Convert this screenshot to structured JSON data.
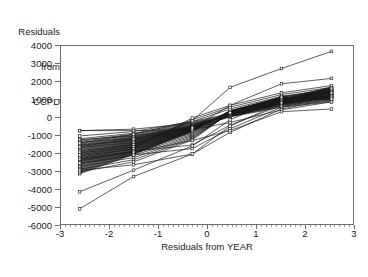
{
  "chart_data": {
    "type": "line",
    "title": "",
    "ylabel_lines": [
      "Residuals",
      "from",
      "CCPD"
    ],
    "xlabel": "Residuals from YEAR",
    "xlim": [
      -3,
      3
    ],
    "ylim": [
      -6000,
      4000
    ],
    "xticks": [
      -3,
      -2,
      -1,
      0,
      1,
      2,
      3
    ],
    "xticklabels": [
      "-3",
      "-2",
      "-1",
      "0",
      "1",
      "2",
      "3"
    ],
    "yticks": [
      -6000,
      -5000,
      -4000,
      -3000,
      -2000,
      -1000,
      0,
      1000,
      2000,
      3000,
      4000
    ],
    "yticklabels": [
      "-6000",
      "-5000",
      "-4000",
      "-3000",
      "-2000",
      "-1000",
      "0",
      "1000",
      "2000",
      "3000",
      "4000"
    ],
    "grid": false,
    "legend": null,
    "marker": "open-square",
    "line_color": "#1a1a1a",
    "frame_color": "#6e6e6e",
    "x": [
      -2.62,
      -1.52,
      -0.32,
      0.45,
      1.5,
      2.52
    ],
    "series": [
      {
        "name": "s1",
        "values": [
          -700,
          -620,
          -300,
          100,
          700,
          1150
        ]
      },
      {
        "name": "s2",
        "values": [
          -1000,
          -750,
          -200,
          250,
          900,
          1250
        ]
      },
      {
        "name": "s3",
        "values": [
          -1150,
          -850,
          -250,
          200,
          850,
          1200
        ]
      },
      {
        "name": "s4",
        "values": [
          -1250,
          -900,
          -300,
          180,
          820,
          1180
        ]
      },
      {
        "name": "s5",
        "values": [
          -1300,
          -950,
          -350,
          150,
          800,
          1160
        ]
      },
      {
        "name": "s6",
        "values": [
          -1400,
          -1000,
          -380,
          140,
          790,
          1200
        ]
      },
      {
        "name": "s7",
        "values": [
          -1450,
          -1050,
          -400,
          130,
          780,
          1220
        ]
      },
      {
        "name": "s8",
        "values": [
          -1500,
          -1080,
          -420,
          120,
          770,
          1150
        ]
      },
      {
        "name": "s9",
        "values": [
          -1550,
          -1100,
          -430,
          140,
          800,
          1260
        ]
      },
      {
        "name": "s10",
        "values": [
          -1600,
          -1150,
          -450,
          150,
          830,
          1300
        ]
      },
      {
        "name": "s11",
        "values": [
          -1650,
          -1180,
          -460,
          160,
          850,
          1340
        ]
      },
      {
        "name": "s12",
        "values": [
          -1700,
          -1200,
          -470,
          170,
          870,
          1380
        ]
      },
      {
        "name": "s13",
        "values": [
          -1750,
          -1230,
          -480,
          180,
          880,
          1400
        ]
      },
      {
        "name": "s14",
        "values": [
          -1800,
          -1260,
          -490,
          190,
          890,
          1420
        ]
      },
      {
        "name": "s15",
        "values": [
          -1850,
          -1290,
          -500,
          200,
          900,
          1440
        ]
      },
      {
        "name": "s16",
        "values": [
          -1900,
          -1320,
          -510,
          210,
          910,
          1460
        ]
      },
      {
        "name": "s17",
        "values": [
          -1950,
          -1350,
          -520,
          220,
          920,
          1480
        ]
      },
      {
        "name": "s18",
        "values": [
          -2000,
          -1380,
          -530,
          230,
          930,
          1500
        ]
      },
      {
        "name": "s19",
        "values": [
          -2050,
          -1400,
          -540,
          240,
          940,
          1520
        ]
      },
      {
        "name": "s20",
        "values": [
          -2100,
          -1430,
          -550,
          250,
          950,
          1540
        ]
      },
      {
        "name": "s21",
        "values": [
          -2150,
          -1460,
          -560,
          255,
          960,
          1560
        ]
      },
      {
        "name": "s22",
        "values": [
          -2200,
          -1490,
          -570,
          260,
          970,
          1580
        ]
      },
      {
        "name": "s23",
        "values": [
          -2250,
          -1520,
          -580,
          265,
          980,
          1600
        ]
      },
      {
        "name": "s24",
        "values": [
          -2300,
          -1550,
          -590,
          270,
          990,
          1620
        ]
      },
      {
        "name": "s25",
        "values": [
          -2350,
          -1580,
          -600,
          275,
          1000,
          1640
        ]
      },
      {
        "name": "s26",
        "values": [
          -2400,
          -1610,
          -610,
          280,
          1010,
          1660
        ]
      },
      {
        "name": "s27",
        "values": [
          -2450,
          -1640,
          -620,
          285,
          1020,
          1680
        ]
      },
      {
        "name": "s28",
        "values": [
          -2500,
          -1670,
          -630,
          290,
          1030,
          1700
        ]
      },
      {
        "name": "s29",
        "values": [
          -2550,
          -1700,
          -640,
          300,
          1040,
          1720
        ]
      },
      {
        "name": "s30",
        "values": [
          -2600,
          -1730,
          -650,
          310,
          1050,
          1500
        ]
      },
      {
        "name": "s31",
        "values": [
          -2650,
          -1760,
          -660,
          320,
          1060,
          1450
        ]
      },
      {
        "name": "s32",
        "values": [
          -2700,
          -1790,
          -670,
          330,
          1070,
          1400
        ]
      },
      {
        "name": "s33",
        "values": [
          -2750,
          -1820,
          -680,
          340,
          1080,
          1350
        ]
      },
      {
        "name": "s34",
        "values": [
          -2800,
          -1850,
          -690,
          350,
          1090,
          1300
        ]
      },
      {
        "name": "s35",
        "values": [
          -2850,
          -1880,
          -700,
          360,
          1100,
          1250
        ]
      },
      {
        "name": "s36",
        "values": [
          -2900,
          -1910,
          -710,
          370,
          1110,
          1200
        ]
      },
      {
        "name": "s37",
        "values": [
          -2950,
          -1940,
          -720,
          380,
          1120,
          1150
        ]
      },
      {
        "name": "s38",
        "values": [
          -3000,
          -1970,
          -730,
          390,
          1130,
          1100
        ]
      },
      {
        "name": "s39",
        "values": [
          -3050,
          -2000,
          -740,
          400,
          1140,
          1050
        ]
      },
      {
        "name": "s40",
        "values": [
          -3100,
          -2030,
          -750,
          410,
          1150,
          1000
        ]
      },
      {
        "name": "s41",
        "values": [
          -1200,
          -1000,
          -500,
          60,
          600,
          900
        ]
      },
      {
        "name": "s42",
        "values": [
          -1350,
          -1120,
          -560,
          80,
          650,
          950
        ]
      },
      {
        "name": "s43",
        "values": [
          -1500,
          -1240,
          -620,
          100,
          700,
          1000
        ]
      },
      {
        "name": "s44",
        "values": [
          -1650,
          -1360,
          -680,
          120,
          750,
          1050
        ]
      },
      {
        "name": "s45",
        "values": [
          -1800,
          -1480,
          -740,
          140,
          800,
          1100
        ]
      },
      {
        "name": "s46",
        "values": [
          -1950,
          -1600,
          -800,
          160,
          850,
          1150
        ]
      },
      {
        "name": "s47",
        "values": [
          -2100,
          -1720,
          -860,
          180,
          900,
          1200
        ]
      },
      {
        "name": "s48",
        "values": [
          -2250,
          -1840,
          -920,
          200,
          950,
          1250
        ]
      },
      {
        "name": "s49",
        "values": [
          -2400,
          -1960,
          -980,
          220,
          1000,
          1300
        ]
      },
      {
        "name": "s50",
        "values": [
          -2550,
          -2080,
          -1040,
          240,
          1050,
          1350
        ]
      },
      {
        "name": "s51",
        "values": [
          -2700,
          -2200,
          -1100,
          260,
          1100,
          1400
        ]
      },
      {
        "name": "s52",
        "values": [
          -2850,
          -2320,
          -1160,
          280,
          1150,
          1450
        ]
      },
      {
        "name": "s53",
        "values": [
          -3000,
          -2440,
          -1220,
          300,
          1200,
          1500
        ]
      },
      {
        "name": "s54",
        "values": [
          -1900,
          -1500,
          -200,
          500,
          1200,
          1600
        ]
      },
      {
        "name": "s55",
        "values": [
          -2050,
          -1600,
          -100,
          600,
          1300,
          1700
        ]
      },
      {
        "name": "s56",
        "values": [
          -2200,
          -1700,
          0,
          700,
          1400,
          1800
        ]
      },
      {
        "name": "s57",
        "values": [
          -2350,
          -1850,
          -1500,
          -400,
          700,
          1250
        ]
      },
      {
        "name": "s58",
        "values": [
          -2500,
          -2050,
          -1700,
          -600,
          600,
          1150
        ]
      },
      {
        "name": "s59",
        "values": [
          -2900,
          -2600,
          -2000,
          -800,
          500,
          1050
        ]
      },
      {
        "name": "outlier-flat-high",
        "values": [
          -700,
          -700,
          -650,
          -250,
          450,
          900
        ]
      },
      {
        "name": "outlier-low-1",
        "values": [
          -4100,
          -2900,
          -1550,
          -100,
          1150,
          1650
        ]
      },
      {
        "name": "outlier-low-2",
        "values": [
          -5050,
          -3250,
          -2000,
          -450,
          850,
          1400
        ]
      },
      {
        "name": "outlier-high-right",
        "values": [
          -1400,
          -900,
          -150,
          1700,
          2750,
          3700
        ]
      },
      {
        "name": "outlier-mid-right",
        "values": [
          -1600,
          -1150,
          -550,
          700,
          1900,
          2200
        ]
      },
      {
        "name": "outlier-low-right",
        "values": [
          -2300,
          -1900,
          -1250,
          -700,
          350,
          500
        ]
      }
    ]
  },
  "caption": {
    "text": ""
  }
}
